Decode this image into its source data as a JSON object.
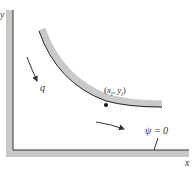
{
  "figure": {
    "axes": {
      "x_label": "x",
      "y_label": "y"
    },
    "labels": {
      "flow_q": "q",
      "point_x": "x",
      "point_xsub": "i",
      "point_y": "y",
      "point_ysub": "i",
      "streamline": "ψ = 0"
    },
    "colors": {
      "wall_fill": "#c8c8c8",
      "wall_edge": "#333333",
      "streamline_fill": "#c9c9c9",
      "streamline_edge": "#222222",
      "background": "#ffffff"
    }
  }
}
